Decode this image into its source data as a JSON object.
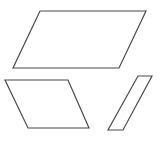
{
  "figure": {
    "name": "parallelograms-figure",
    "width": 161,
    "height": 141,
    "background_color": "#ffffff",
    "stroke_color": "#4a4a4a",
    "fill_color": "#ffffff",
    "stroke_width": 1.2,
    "shape_count": 3,
    "shapes": [
      {
        "id": "large-parallelogram",
        "label": "large wide parallelogram",
        "points": "40,11 146,11 119,68 13,68"
      },
      {
        "id": "medium-parallelogram",
        "label": "medium lower-left parallelogram",
        "points": "5,80 68,80 89,128 28,128"
      },
      {
        "id": "narrow-parallelogram",
        "label": "narrow slanted parallelogram",
        "points": "138,76 152,76 123,130 108,130"
      }
    ]
  }
}
